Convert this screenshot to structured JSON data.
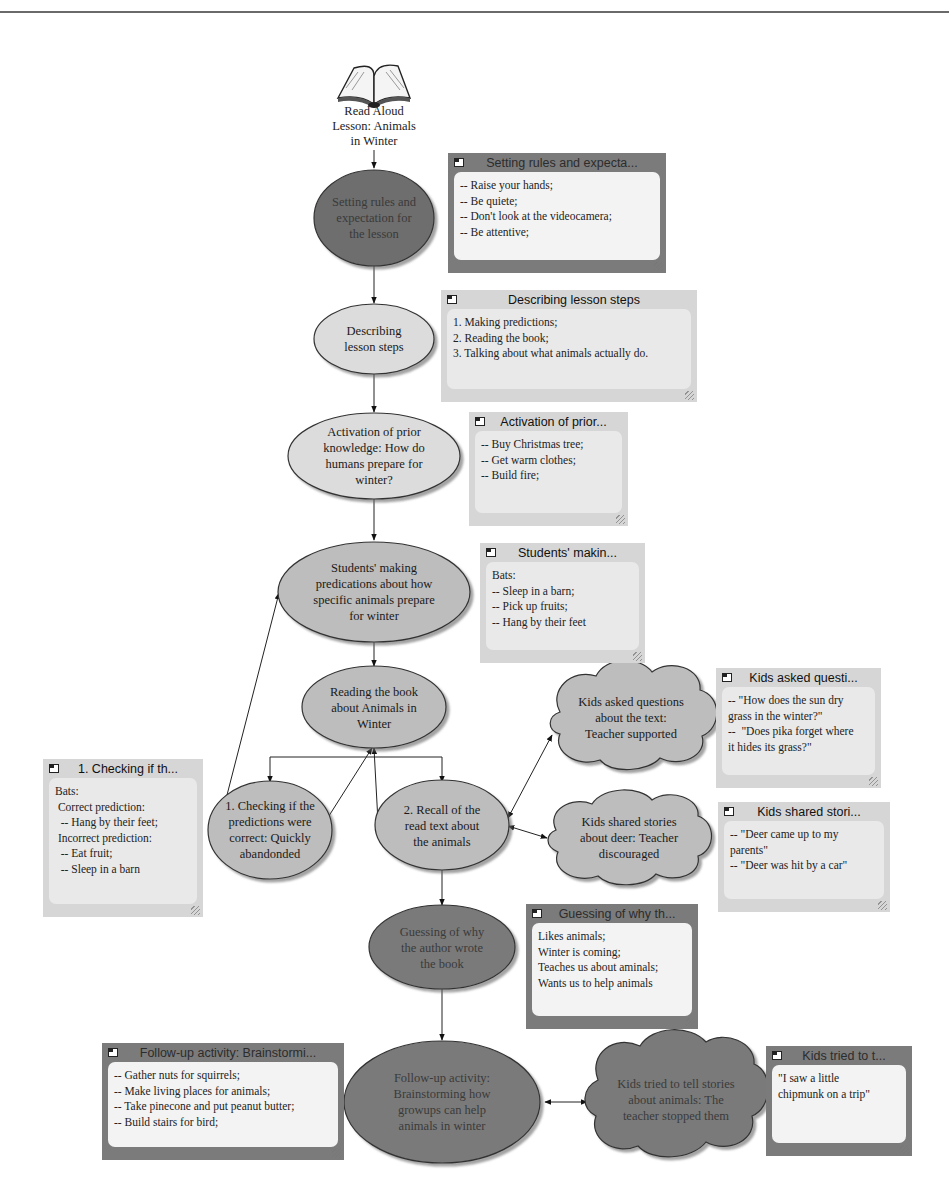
{
  "diagram": {
    "title": "Read Aloud Lesson: Animals in Winter",
    "root": {
      "label": "Read Aloud\nLesson: Animals\nin Winter",
      "icon": "open-book-icon"
    },
    "nodes": [
      {
        "id": "rules",
        "shape": "ellipse",
        "fill": "#6e6e6e",
        "label": "Setting rules and\nexpectation for\nthe lesson"
      },
      {
        "id": "steps",
        "shape": "ellipse",
        "fill": "#dcdcdc",
        "label": "Describing\nlesson steps"
      },
      {
        "id": "prior",
        "shape": "ellipse",
        "fill": "#dcdcdc",
        "label": "Activation of prior\nknowledge: How do\nhumans prepare for\nwinter?"
      },
      {
        "id": "predict",
        "shape": "ellipse",
        "fill": "#bdbdbd",
        "label": "Students' making\npredications about how\nspecific animals prepare\nfor winter"
      },
      {
        "id": "reading",
        "shape": "ellipse",
        "fill": "#bdbdbd",
        "label": "Reading the book\nabout Animals in\nWinter"
      },
      {
        "id": "checking",
        "shape": "ellipse",
        "fill": "#bdbdbd",
        "label": "1. Checking if the\npredictions were\ncorrect: Quickly\nabandonded"
      },
      {
        "id": "recall",
        "shape": "ellipse",
        "fill": "#bdbdbd",
        "label": "2. Recall of the\nread text about\nthe animals"
      },
      {
        "id": "questions",
        "shape": "cloud",
        "fill": "#bdbdbd",
        "label": "Kids asked questions\nabout the text:\nTeacher supported"
      },
      {
        "id": "deer",
        "shape": "cloud",
        "fill": "#bdbdbd",
        "label": "Kids shared stories\nabout deer: Teacher\ndiscouraged"
      },
      {
        "id": "guessing",
        "shape": "ellipse",
        "fill": "#7a7a7a",
        "label": "Guessing of why\nthe author wrote\nthe book"
      },
      {
        "id": "followup",
        "shape": "ellipse",
        "fill": "#7a7a7a",
        "label": "Follow-up activity:\nBrainstorming how\ngrowups can help\nanimals in winter"
      },
      {
        "id": "stories",
        "shape": "cloud",
        "fill": "#7a7a7a",
        "label": "Kids tried to tell stories\nabout animals: The\nteacher stopped them"
      }
    ],
    "notes": [
      {
        "id": "note-rules",
        "tone": "dark",
        "title": "Setting rules and expecta...",
        "body": "-- Raise your hands;\n-- Be quiete;\n-- Don't look at the videocamera;\n-- Be attentive;"
      },
      {
        "id": "note-steps",
        "tone": "light",
        "title": "Describing lesson steps",
        "body": "1. Making predictions;\n2. Reading the book;\n3. Talking about what animals actually do."
      },
      {
        "id": "note-prior",
        "tone": "light",
        "title": "Activation of prior...",
        "body": "-- Buy Christmas tree;\n-- Get warm clothes;\n-- Build fire;"
      },
      {
        "id": "note-predict",
        "tone": "light",
        "title": "Students' makin...",
        "body": "Bats:\n-- Sleep in a barn;\n-- Pick up fruits;\n-- Hang by their feet"
      },
      {
        "id": "note-questions",
        "tone": "light",
        "title": "Kids asked questi...",
        "body": "-- \"How does the sun dry\ngrass in the winter?\"\n--  \"Does pika forget where\nit hides its grass?\""
      },
      {
        "id": "note-checking",
        "tone": "light",
        "title": "1. Checking if th...",
        "body": "Bats:\n Correct prediction:\n  -- Hang by their feet;\n Incorrect prediction:\n  -- Eat fruit;\n  -- Sleep in a barn"
      },
      {
        "id": "note-deer",
        "tone": "light",
        "title": "Kids shared stori...",
        "body": "-- \"Deer came up to my\nparents\"\n-- \"Deer was hit by a car\""
      },
      {
        "id": "note-guessing",
        "tone": "dark",
        "title": "Guessing of why th...",
        "body": "Likes animals;\nWinter is coming;\nTeaches us about aminals;\nWants us to help animals"
      },
      {
        "id": "note-followup",
        "tone": "dark",
        "title": "Follow-up activity: Brainstormi...",
        "body": "-- Gather nuts for squirrels;\n-- Make living places for animals;\n-- Take pinecone and put peanut butter;\n-- Build stairs for bird;"
      },
      {
        "id": "note-stories",
        "tone": "dark",
        "title": "Kids tried to t...",
        "body": "\"I saw a little\nchipmunk on a trip\""
      }
    ],
    "edges": [
      {
        "from": "root",
        "to": "rules"
      },
      {
        "from": "rules",
        "to": "steps"
      },
      {
        "from": "steps",
        "to": "prior"
      },
      {
        "from": "prior",
        "to": "predict"
      },
      {
        "from": "predict",
        "to": "reading"
      },
      {
        "from": "reading",
        "to": "checking"
      },
      {
        "from": "reading",
        "to": "recall"
      },
      {
        "from": "checking",
        "to": "reading"
      },
      {
        "from": "checking",
        "to": "predict"
      },
      {
        "from": "recall",
        "to": "reading"
      },
      {
        "from": "recall",
        "to": "questions",
        "bidirectional": true
      },
      {
        "from": "recall",
        "to": "deer",
        "bidirectional": true
      },
      {
        "from": "recall",
        "to": "guessing"
      },
      {
        "from": "guessing",
        "to": "followup"
      },
      {
        "from": "followup",
        "to": "stories",
        "bidirectional": true
      }
    ],
    "colors": {
      "line": "#222222",
      "top_rule": "#6a6a6a",
      "note_light": "#d6d6d6",
      "note_dark": "#7b7b7b",
      "note_body": "#f3f3f3"
    }
  }
}
